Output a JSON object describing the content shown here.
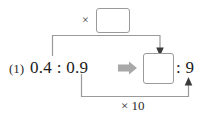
{
  "diagram": {
    "item_number": "(1)",
    "ratio_original": "0.4 : 0.9",
    "ratio_left_term": "0.4",
    "ratio_right_term": "0.9",
    "ratio_result": ": 9",
    "ratio_result_term": "9",
    "top_multiplier_label": "×",
    "top_multiplier_value": "",
    "bottom_multiplier_label": "× 10",
    "transform_arrow": "⇒",
    "colors": {
      "ink": "#1a1a1a",
      "line": "#9a9a9a",
      "box_border": "#9a9a9a",
      "block_arrow": "#a8a8a8",
      "background": "#ffffff"
    }
  }
}
